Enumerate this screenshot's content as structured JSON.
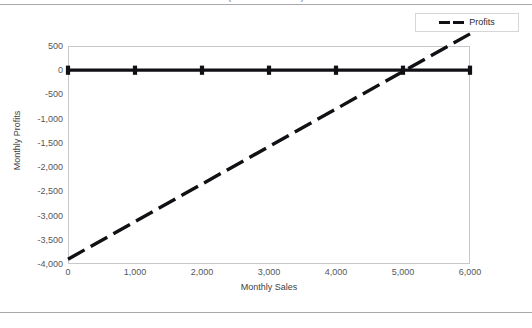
{
  "page": {
    "clipped_caption": "(Sales and Profits)"
  },
  "legend": {
    "entries": [
      {
        "label": "Profits",
        "color": "#111115",
        "style": "dashed"
      }
    ]
  },
  "chart_data": {
    "type": "line",
    "title": "",
    "xlabel": "Monthly Sales",
    "ylabel": "Monthly Profits",
    "xlim": [
      0,
      6000
    ],
    "ylim": [
      -4000,
      500
    ],
    "grid": false,
    "legend_position": "top-right",
    "x_ticks": [
      "0",
      "1,000",
      "2,000",
      "3,000",
      "4,000",
      "5,000",
      "6,000"
    ],
    "x_tick_values": [
      0,
      1000,
      2000,
      3000,
      4000,
      5000,
      6000
    ],
    "y_ticks": [
      "500",
      "0",
      "-500",
      "-1,000",
      "-1,500",
      "-2,000",
      "-2,500",
      "-3,000",
      "-3,500",
      "-4,000"
    ],
    "y_tick_values": [
      500,
      0,
      -500,
      -1000,
      -1500,
      -2000,
      -2500,
      -3000,
      -3500,
      -4000
    ],
    "series": [
      {
        "name": "Profits",
        "style": "dashed",
        "color": "#111115",
        "x": [
          0,
          1000,
          2000,
          3000,
          4000,
          5000,
          6000
        ],
        "values": [
          -3900,
          -3125,
          -2350,
          -1575,
          -800,
          -25,
          750
        ]
      },
      {
        "name": "Zero Reference",
        "style": "solid-markers",
        "color": "#111115",
        "x": [
          0,
          1000,
          2000,
          3000,
          4000,
          5000,
          6000
        ],
        "values": [
          0,
          0,
          0,
          0,
          0,
          0,
          0
        ]
      }
    ],
    "breakeven_x": 5032
  }
}
